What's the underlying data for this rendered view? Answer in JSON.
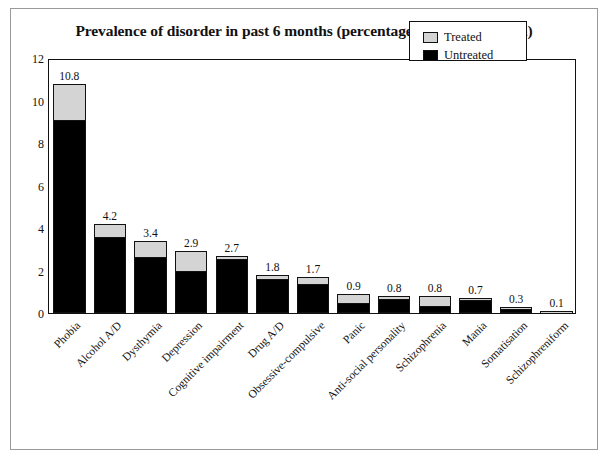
{
  "figure": {
    "title": "Prevalence of disorder in past 6 months (percentage of the population)"
  },
  "legend": {
    "items": [
      {
        "label": "Treated",
        "color": "#d4d4d4",
        "icon": "square-swatch-icon"
      },
      {
        "label": "Untreated",
        "color": "#000000",
        "icon": "square-swatch-icon"
      }
    ]
  },
  "chart_data": {
    "type": "bar",
    "subtype": "stacked",
    "title": "Prevalence of disorder in past 6 months (percentage of the population)",
    "xlabel": "",
    "ylabel": "",
    "ylim": [
      0,
      12
    ],
    "yticks": [
      0,
      2,
      4,
      6,
      8,
      10,
      12
    ],
    "ytick_labels": [
      "0",
      "2",
      "4",
      "6",
      "8",
      "10",
      "12"
    ],
    "grid": false,
    "legend_position": "top-right",
    "categories": [
      "Phobia",
      "Alcohol A/D",
      "Dysthymia",
      "Depression",
      "Cognitive impairment",
      "Drug A/D",
      "Obsessive-compulsive",
      "Panic",
      "Anti-social personality",
      "Schizophrenia",
      "Mania",
      "Somatisation",
      "Schizophreniform"
    ],
    "totals": [
      10.8,
      4.2,
      3.4,
      2.9,
      2.7,
      1.8,
      1.7,
      0.9,
      0.8,
      0.8,
      0.7,
      0.3,
      0.1
    ],
    "data_labels": [
      "10.8",
      "4.2",
      "3.4",
      "2.9",
      "2.7",
      "1.8",
      "1.7",
      "0.9",
      "0.8",
      "0.8",
      "0.7",
      "0.3",
      "0.1"
    ],
    "series": [
      {
        "name": "Untreated",
        "color": "#000000",
        "values": [
          9.1,
          3.6,
          2.65,
          2.0,
          2.55,
          1.6,
          1.35,
          0.45,
          0.68,
          0.35,
          0.6,
          0.18,
          0.06
        ]
      },
      {
        "name": "Treated",
        "color": "#d4d4d4",
        "values": [
          1.7,
          0.6,
          0.75,
          0.9,
          0.15,
          0.2,
          0.35,
          0.45,
          0.12,
          0.45,
          0.1,
          0.12,
          0.04
        ]
      }
    ]
  }
}
